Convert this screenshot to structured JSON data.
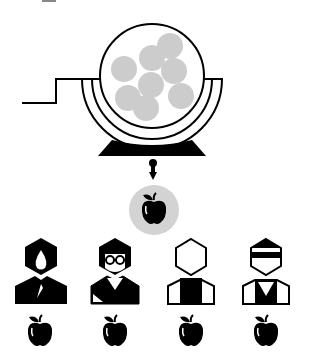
{
  "diagram": {
    "title": "",
    "colors": {
      "stroke": "#000000",
      "ball_fill": "#cccccc",
      "background": "#ffffff",
      "drawn_ball_fill": "#d3d3d3"
    },
    "drum": {
      "label": "lottery-drum",
      "ball_count": 9
    },
    "drawn_item": "apple",
    "people": [
      {
        "id": "person-1",
        "style": "man-dark-beard",
        "receives": "apple"
      },
      {
        "id": "person-2",
        "style": "woman-glasses",
        "receives": "apple"
      },
      {
        "id": "person-3",
        "style": "person-outline",
        "receives": "apple"
      },
      {
        "id": "person-4",
        "style": "person-visor",
        "receives": "apple"
      }
    ]
  }
}
